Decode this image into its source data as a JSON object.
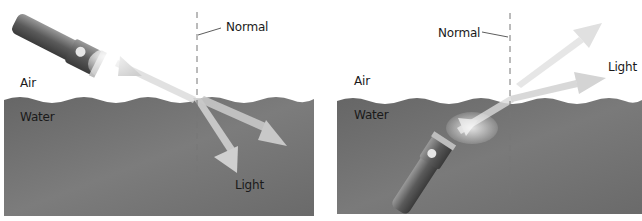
{
  "panels": [
    {
      "id": "flashlight-in-air",
      "labels": {
        "normal": "Normal",
        "air": "Air",
        "water": "Water",
        "light": "Light"
      }
    },
    {
      "id": "flashlight-in-water",
      "labels": {
        "normal": "Normal",
        "air": "Air",
        "water": "Water",
        "light": "Light"
      }
    }
  ],
  "colors": {
    "water": "#6e6e6e",
    "water_light": "#8a8a8a",
    "beam": "#d9d9d9",
    "normal_line": "#777777",
    "text": "#1a1a1a"
  }
}
